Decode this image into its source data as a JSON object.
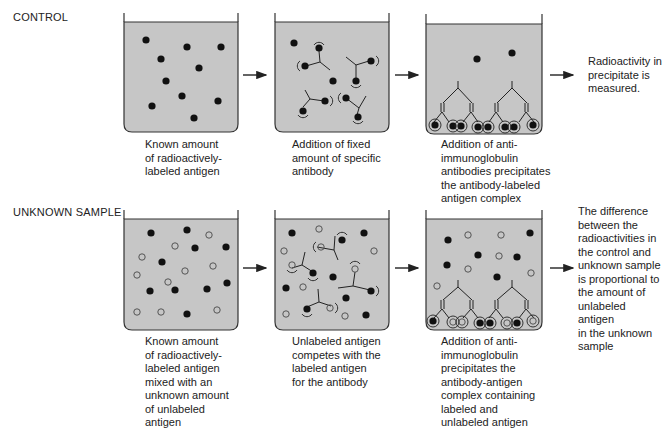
{
  "rows": [
    {
      "label": "CONTROL",
      "steps": [
        {
          "caption": "Known amount\nof radioactively-\nlabeled antigen"
        },
        {
          "caption": "Addition of fixed\namount of specific\nantibody"
        },
        {
          "caption": "Addition of anti-\nimmunoglobulin\nantibodies precipitates\nthe antibody-labeled\nantigen complex"
        }
      ],
      "result": "Radioactivity in\nprecipitate is\nmeasured."
    },
    {
      "label": "UNKNOWN SAMPLE",
      "steps": [
        {
          "caption": "Known amount\nof radioactively-\nlabeled antigen\nmixed with an\nunknown amount\nof unlabeled\nantigen"
        },
        {
          "caption": "Unlabeled antigen\ncompetes with the\nlabeled antigen\nfor the antibody"
        },
        {
          "caption": "Addition of anti-\nimmunoglobulin\nprecipitates the\nantibody-antigen\ncomplex containing\nlabeled and\nunlabeled antigen"
        }
      ],
      "result": "The difference\nbetween the\nradioactivities in\nthe control and\nunknown sample\nis proportional to\nthe amount of\nunlabeled antigen\nin the unknown\nsample"
    }
  ],
  "legend": {
    "filled_circle": "radioactively-labeled antigen",
    "open_circle": "unlabeled antigen"
  },
  "colors": {
    "fluid": "#c6c6c6",
    "outline": "#333333",
    "labeled_antigen": "#111111",
    "unlabeled_antigen": "#555555"
  }
}
